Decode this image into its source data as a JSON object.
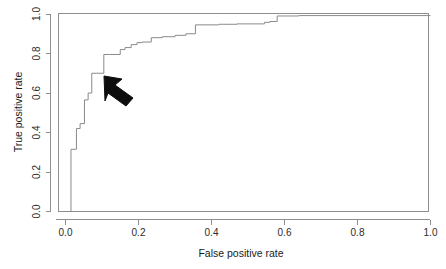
{
  "figure": {
    "background_color": "#ffffff",
    "line_color": "#8a8a8a",
    "frame_color": "#8e8e8e",
    "annotation_color": "#0d0d0d"
  },
  "axes": {
    "x_title": "False positive rate",
    "y_title": "True positive rate",
    "x_ticks": [
      "0.0",
      "0.2",
      "0.4",
      "0.6",
      "0.8",
      "1.0"
    ],
    "y_ticks": [
      "0.0",
      "0.2",
      "0.4",
      "0.6",
      "0.8",
      "1.0"
    ]
  },
  "annotation": {
    "name": "pointer-arrow",
    "description": "black arrow pointing up-left at the ROC curve",
    "points_at_x": 0.105,
    "points_at_y": 0.7
  },
  "chart_data": {
    "type": "line",
    "title": "",
    "xlabel": "False positive rate",
    "ylabel": "True positive rate",
    "xlim": [
      0.0,
      1.0
    ],
    "ylim": [
      0.0,
      1.0
    ],
    "xticks": [
      0.0,
      0.2,
      0.4,
      0.6,
      0.8,
      1.0
    ],
    "yticks": [
      0.0,
      0.2,
      0.4,
      0.6,
      0.8,
      1.0
    ],
    "grid": false,
    "legend": null,
    "series": [
      {
        "name": "ROC curve",
        "step": "post",
        "x": [
          0.0,
          0.015,
          0.015,
          0.03,
          0.03,
          0.04,
          0.04,
          0.052,
          0.052,
          0.062,
          0.062,
          0.072,
          0.072,
          0.086,
          0.086,
          0.105,
          0.105,
          0.12,
          0.12,
          0.15,
          0.15,
          0.163,
          0.163,
          0.18,
          0.18,
          0.196,
          0.196,
          0.21,
          0.21,
          0.235,
          0.235,
          0.265,
          0.265,
          0.3,
          0.3,
          0.33,
          0.33,
          0.356,
          0.356,
          0.42,
          0.42,
          0.47,
          0.47,
          0.545,
          0.545,
          0.56,
          0.56,
          0.58,
          0.58,
          0.64,
          0.64,
          1.0
        ],
        "y": [
          0.0,
          0.0,
          0.315,
          0.315,
          0.42,
          0.42,
          0.445,
          0.445,
          0.565,
          0.565,
          0.6,
          0.6,
          0.7,
          0.7,
          0.7,
          0.7,
          0.795,
          0.795,
          0.795,
          0.795,
          0.82,
          0.82,
          0.83,
          0.83,
          0.845,
          0.845,
          0.855,
          0.855,
          0.858,
          0.858,
          0.88,
          0.88,
          0.885,
          0.885,
          0.892,
          0.892,
          0.9,
          0.9,
          0.945,
          0.945,
          0.948,
          0.948,
          0.95,
          0.95,
          0.958,
          0.958,
          0.962,
          0.962,
          0.99,
          0.99,
          0.992,
          0.992
        ]
      }
    ]
  }
}
